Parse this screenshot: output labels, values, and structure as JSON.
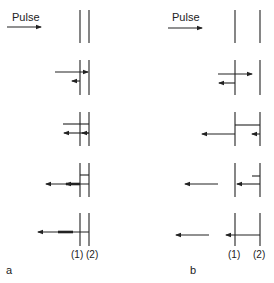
{
  "figure": {
    "panels": [
      {
        "id": "a",
        "panel_label": "a",
        "pulse_label": "Pulse",
        "boundary_labels": [
          "(1)",
          "(2)"
        ],
        "rows": 5
      },
      {
        "id": "b",
        "panel_label": "b",
        "pulse_label": "Pulse",
        "boundary_labels": [
          "(1)",
          "(2)"
        ],
        "rows": 5
      }
    ],
    "colors": {
      "ink": "#222222",
      "background": "#ffffff"
    }
  }
}
